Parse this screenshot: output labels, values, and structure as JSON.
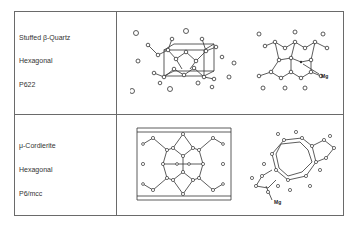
{
  "rows": [
    {
      "name": "Stuffed β-Quartz",
      "system": "Hexagonal",
      "space_group": "P622",
      "annotation": "Mg"
    },
    {
      "name": "μ-Cordierite",
      "system": "Hexagonal",
      "space_group": "P6/mcc",
      "annotation": "Mg"
    }
  ]
}
